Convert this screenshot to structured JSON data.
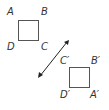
{
  "figure": {
    "original": {
      "labels": {
        "A": "A",
        "B": "B",
        "C": "C",
        "D": "D"
      }
    },
    "image": {
      "labels": {
        "A": "A′",
        "B": "B′",
        "C": "C′",
        "D": "D′"
      }
    },
    "colors": {
      "stroke": "#555555",
      "arrow": "#222222"
    }
  }
}
